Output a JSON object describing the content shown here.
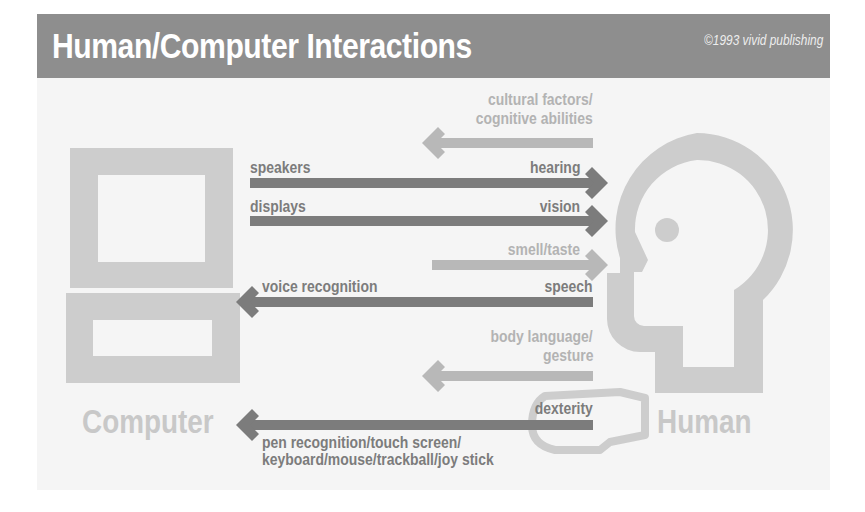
{
  "header": {
    "title": "Human/Computer Interactions",
    "copyright": "©1993 vivid publishing"
  },
  "entities": {
    "computer": "Computer",
    "human": "Human"
  },
  "colors": {
    "header_bg": "#8e8e8e",
    "panel_bg": "#f5f5f5",
    "dark_arrow": "#7c7c7c",
    "light_arrow": "#b8b8b8",
    "figure": "#cdcdcd"
  },
  "channels": [
    {
      "direction": "human-to-computer",
      "human_label": "cultural factors/ cognitive abilities",
      "computer_label": "",
      "human_line1": "cultural factors/",
      "human_line2": "cognitive abilities",
      "style": "light"
    },
    {
      "direction": "computer-to-human",
      "computer_label": "speakers",
      "human_label": "hearing",
      "style": "dark"
    },
    {
      "direction": "computer-to-human",
      "computer_label": "displays",
      "human_label": "vision",
      "style": "dark"
    },
    {
      "direction": "to-human",
      "computer_label": "",
      "human_label": "smell/taste",
      "style": "light"
    },
    {
      "direction": "human-to-computer",
      "computer_label": "voice recognition",
      "human_label": "speech",
      "style": "dark"
    },
    {
      "direction": "human-to-computer",
      "computer_label": "",
      "human_label": "body language/ gesture",
      "human_line1": "body language/",
      "human_line2": "gesture",
      "style": "light"
    },
    {
      "direction": "human-to-computer",
      "computer_label": "pen recognition/touch screen/ keyboard/mouse/trackball/joy stick",
      "computer_line1": "pen recognition/touch screen/",
      "computer_line2": "keyboard/mouse/trackball/joy stick",
      "human_label": "dexterity",
      "style": "dark"
    }
  ]
}
